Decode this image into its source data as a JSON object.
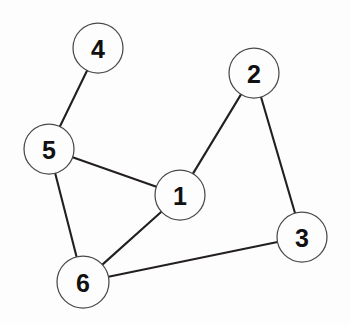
{
  "figure": {
    "kind": "undirected-graph-diagram",
    "width": 350,
    "height": 324,
    "background_color": "#fdfdfd",
    "edge_color": "#231f20",
    "node_fill_color": "#fdfdfd",
    "node_stroke_color": "#4a4a4a",
    "label_color": "#111111"
  },
  "graph": {
    "node_radius": 25,
    "nodes": [
      {
        "id": "1",
        "label": "1",
        "cx": 180,
        "cy": 195,
        "r": 25
      },
      {
        "id": "2",
        "label": "2",
        "cx": 254,
        "cy": 73,
        "r": 25
      },
      {
        "id": "3",
        "label": "3",
        "cx": 302,
        "cy": 237,
        "r": 25
      },
      {
        "id": "4",
        "label": "4",
        "cx": 98,
        "cy": 48,
        "r": 25
      },
      {
        "id": "5",
        "label": "5",
        "cx": 49,
        "cy": 149,
        "r": 25
      },
      {
        "id": "6",
        "label": "6",
        "cx": 83,
        "cy": 282,
        "r": 26
      }
    ],
    "edges": [
      {
        "id": "edge-4-5",
        "source": "4",
        "target": "5"
      },
      {
        "id": "edge-5-1",
        "source": "5",
        "target": "1"
      },
      {
        "id": "edge-5-6",
        "source": "5",
        "target": "6"
      },
      {
        "id": "edge-1-2",
        "source": "1",
        "target": "2"
      },
      {
        "id": "edge-1-6",
        "source": "1",
        "target": "6"
      },
      {
        "id": "edge-2-3",
        "source": "2",
        "target": "3"
      },
      {
        "id": "edge-6-3",
        "source": "6",
        "target": "3"
      }
    ]
  }
}
